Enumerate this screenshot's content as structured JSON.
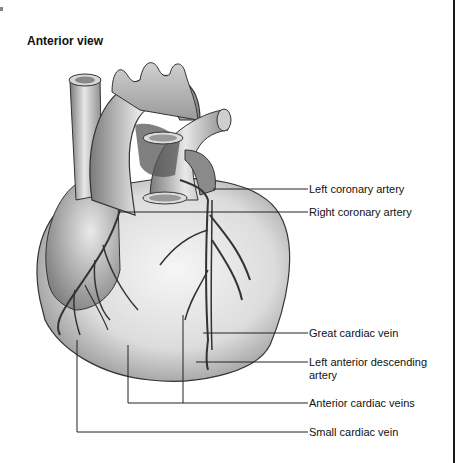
{
  "title": "Anterior view",
  "labels": [
    {
      "id": "left-coronary-artery",
      "text": "Left coronary artery",
      "y": 189
    },
    {
      "id": "right-coronary-artery",
      "text": "Right coronary artery",
      "y": 212
    },
    {
      "id": "great-cardiac-vein",
      "text": "Great cardiac vein",
      "y": 333
    },
    {
      "id": "left-anterior-descending-artery",
      "line1": "Left anterior descending",
      "line2": "artery",
      "y": 362
    },
    {
      "id": "anterior-cardiac-veins",
      "text": "Anterior cardiac veins",
      "y": 403
    },
    {
      "id": "small-cardiac-vein",
      "text": "Small cardiac vein",
      "y": 432
    }
  ],
  "colors": {
    "ink": "#111111",
    "line": "#222222",
    "heart_light": "#eeeeee",
    "heart_dark": "#6e6e6e"
  }
}
